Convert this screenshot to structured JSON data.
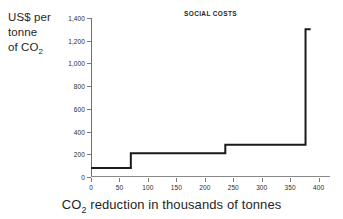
{
  "axis_caption_left": {
    "line1": "US$ per",
    "line2": "tonne",
    "line3_pre": "of CO",
    "line3_sub": "2"
  },
  "caption_bottom": {
    "pre": "CO",
    "sub": "2",
    "post": " reduction in thousands of tonnes"
  },
  "chart_data": {
    "type": "line",
    "subtype": "step",
    "title": "SOCIAL COSTS",
    "xlabel": "CO2 reduction in thousands of tonnes",
    "ylabel": "US$ per tonne of CO2",
    "xlim": [
      0,
      420
    ],
    "ylim": [
      0,
      1400
    ],
    "grid": false,
    "legend": false,
    "xticks": [
      0,
      50,
      100,
      150,
      200,
      250,
      300,
      350,
      400
    ],
    "xtick_labels": [
      "0",
      "50",
      "100",
      "150",
      "200",
      "250",
      "300",
      "350",
      "400"
    ],
    "yticks": [
      0,
      200,
      400,
      600,
      800,
      1000,
      1200,
      1400
    ],
    "ytick_labels": [
      "0",
      "200",
      "400",
      "600",
      "800",
      "1,000",
      "1,200",
      "1,400"
    ],
    "line_color": "#1a1a1a",
    "line_width": 2,
    "steps": [
      {
        "x_start": 0,
        "x_end": 70,
        "value": 80
      },
      {
        "x_start": 70,
        "x_end": 236,
        "value": 210
      },
      {
        "x_start": 236,
        "x_end": 377,
        "value": 285
      },
      {
        "x_start": 377,
        "x_end": 386,
        "value": 1300
      }
    ],
    "points": [
      [
        0,
        80
      ],
      [
        70,
        80
      ],
      [
        70,
        210
      ],
      [
        236,
        210
      ],
      [
        236,
        285
      ],
      [
        377,
        285
      ],
      [
        377,
        1300
      ],
      [
        386,
        1300
      ]
    ]
  }
}
